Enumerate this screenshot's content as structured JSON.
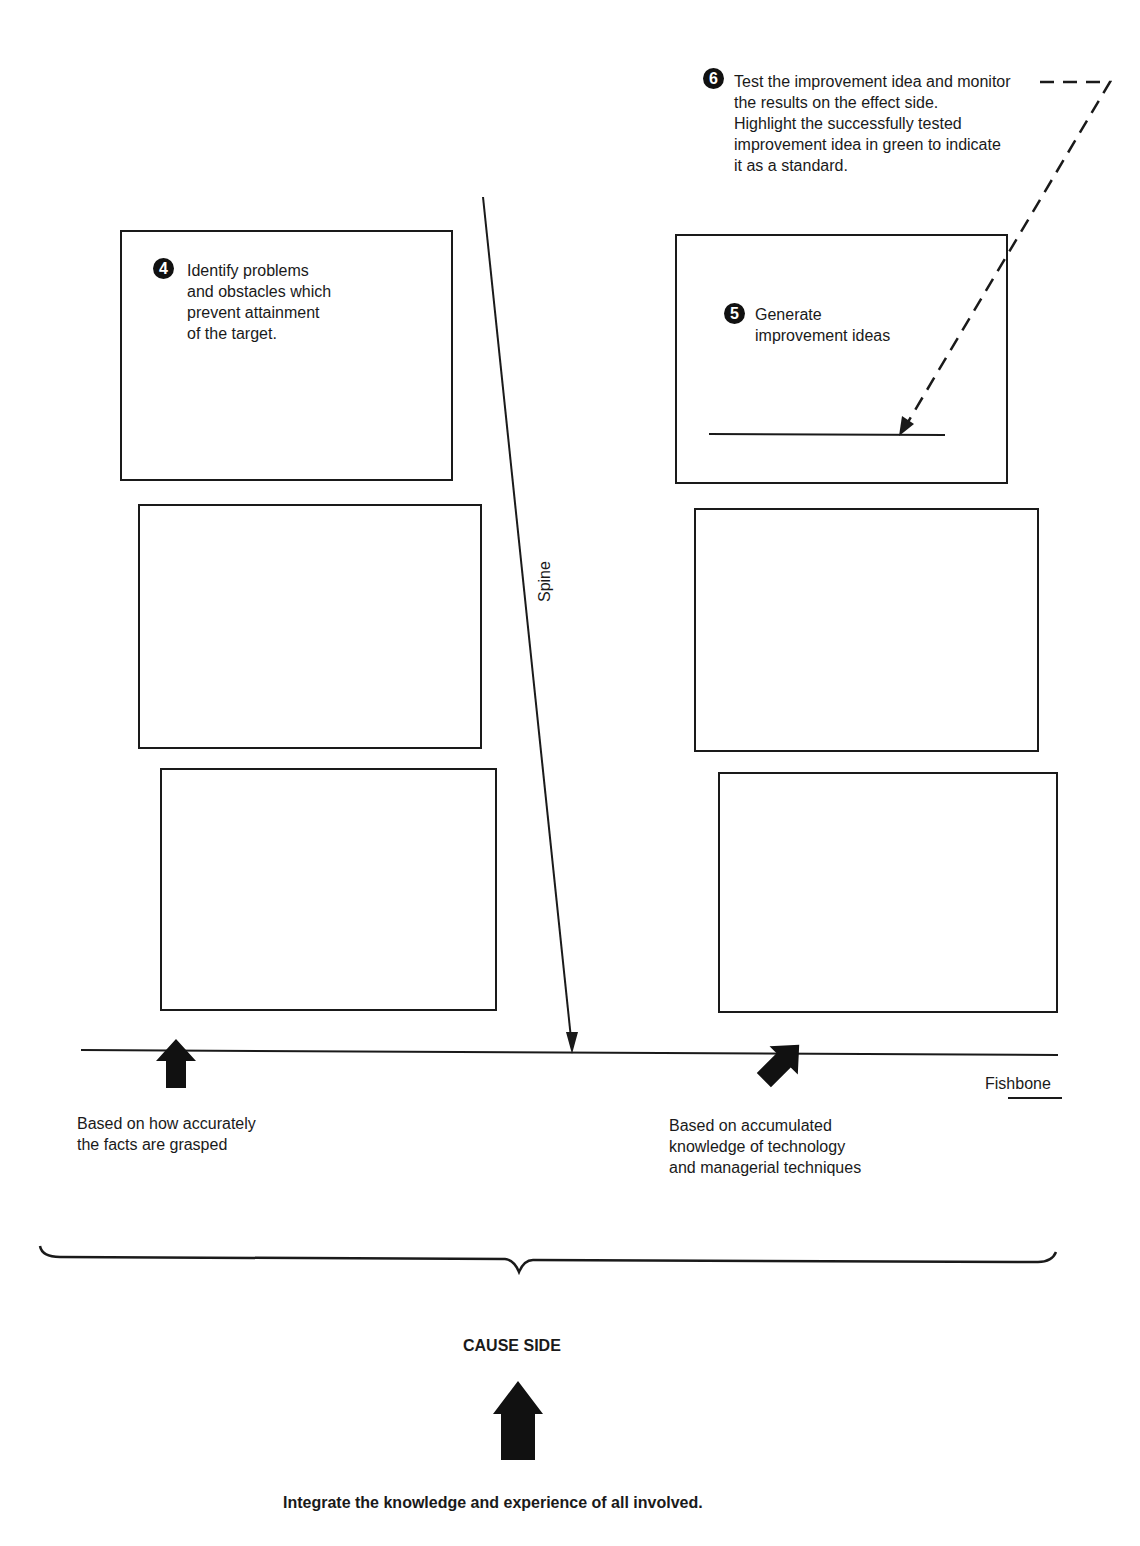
{
  "diagram": {
    "step6": {
      "number": "6",
      "lines": [
        "Test  the improvement idea and monitor",
        "the results on the effect side.",
        "Highlight the successfully tested",
        "improvement idea in green to indicate",
        "it as a standard."
      ]
    },
    "step4": {
      "number": "4",
      "lines": [
        "Identify problems",
        "and obstacles which",
        "prevent attainment",
        "of the target."
      ]
    },
    "step5": {
      "number": "5",
      "lines": [
        "Generate",
        "improvement ideas"
      ]
    },
    "spine_label": "Spine",
    "fishbone_label": "Fishbone",
    "left_note": {
      "lines": [
        "Based on how accurately",
        "the facts are grasped"
      ]
    },
    "right_note": {
      "lines": [
        "Based on accumulated",
        "knowledge of technology",
        "and managerial techniques"
      ]
    },
    "cause_side_label": "CAUSE SIDE",
    "footer": "Integrate the knowledge and experience of all involved."
  }
}
